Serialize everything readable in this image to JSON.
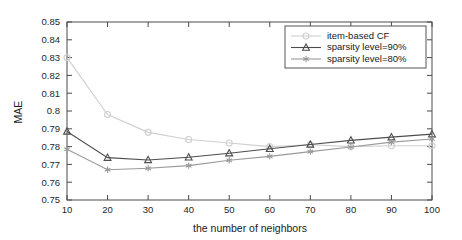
{
  "chart_data": {
    "type": "line",
    "title": "",
    "xlabel": "the number of neighbors",
    "ylabel": "MAE",
    "x": [
      10,
      20,
      30,
      40,
      50,
      60,
      70,
      80,
      90,
      100
    ],
    "xlim": [
      10,
      100
    ],
    "ylim": [
      0.75,
      0.85
    ],
    "xticks": [
      "10",
      "20",
      "30",
      "40",
      "50",
      "60",
      "70",
      "80",
      "90",
      "100"
    ],
    "yticks": [
      "0.75",
      "0.76",
      "0.77",
      "0.78",
      "0.79",
      "0.8",
      "0.81",
      "0.82",
      "0.83",
      "0.84",
      "0.85"
    ],
    "grid": false,
    "legend_position": "top-right",
    "series": [
      {
        "name": "item-based CF",
        "marker": "circle",
        "color": "#cfcfcf",
        "values": [
          0.83,
          0.798,
          0.788,
          0.784,
          0.782,
          0.78,
          0.781,
          0.78,
          0.7805,
          0.7805
        ]
      },
      {
        "name": "sparsity level=90%",
        "marker": "triangle",
        "color": "#4d4d4d",
        "values": [
          0.7885,
          0.7738,
          0.7725,
          0.774,
          0.7763,
          0.7788,
          0.7812,
          0.7835,
          0.7853,
          0.787
        ]
      },
      {
        "name": "sparsity level=80%",
        "marker": "star",
        "color": "#9a9a9a",
        "values": [
          0.7785,
          0.767,
          0.7678,
          0.7693,
          0.7723,
          0.7745,
          0.7772,
          0.7798,
          0.7825,
          0.7843
        ]
      }
    ]
  },
  "axes": {
    "y_title": "MAE",
    "x_title": "the number of neighbors"
  },
  "legend": {
    "entries": [
      {
        "label": "item-based CF"
      },
      {
        "label": "sparsity level=90%"
      },
      {
        "label": "sparsity level=80%"
      }
    ]
  },
  "colors": {
    "axis": "#4a4a4a",
    "text": "#1a1a1a",
    "background": "#ffffff",
    "series_item_based_cf": "#cfcfcf",
    "series_sparsity_90": "#4d4d4d",
    "series_sparsity_80": "#9a9a9a"
  }
}
